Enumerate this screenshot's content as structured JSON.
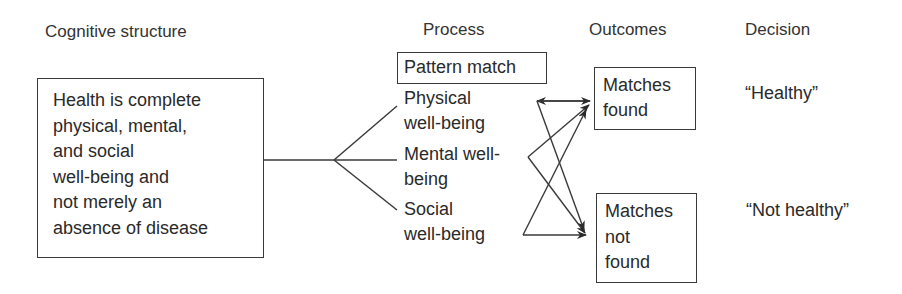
{
  "headers": {
    "cognitive_structure": "Cognitive structure",
    "process": "Process",
    "outcomes": "Outcomes",
    "decision": "Decision"
  },
  "cognitive_box": {
    "lines": [
      "Health is complete",
      "physical, mental,",
      "and social",
      "well-being and",
      "not merely an",
      "absence of disease"
    ]
  },
  "process": {
    "box_label": "Pattern match",
    "items": [
      {
        "name": "physical",
        "lines": [
          "Physical",
          "well-being"
        ]
      },
      {
        "name": "mental",
        "lines": [
          "Mental well-",
          "being"
        ]
      },
      {
        "name": "social",
        "lines": [
          "Social",
          "well-being"
        ]
      }
    ]
  },
  "outcomes": [
    {
      "name": "matches-found",
      "lines": [
        "Matches",
        "found"
      ]
    },
    {
      "name": "matches-not-found",
      "lines": [
        "Matches",
        "not",
        "found"
      ]
    }
  ],
  "decisions": [
    {
      "name": "healthy",
      "label": "“Healthy”"
    },
    {
      "name": "not-healthy",
      "label": "“Not healthy”"
    }
  ],
  "colors": {
    "line": "#3a3a3a",
    "text": "#2a2a2a",
    "background": "#ffffff"
  }
}
